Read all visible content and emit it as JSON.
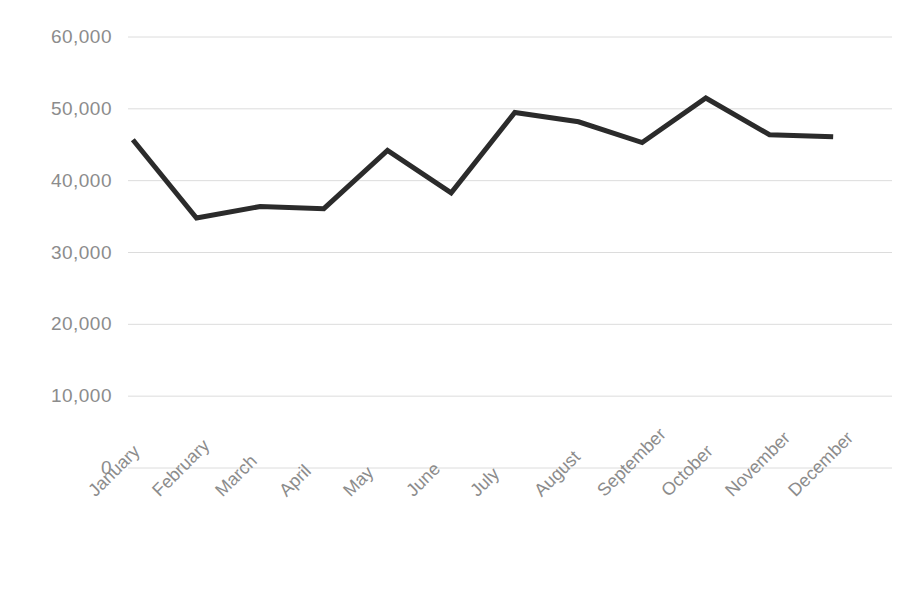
{
  "chart_data": {
    "type": "line",
    "title": "",
    "subtitle": "",
    "xlabel": "",
    "ylabel": "",
    "categories": [
      "January",
      "February",
      "March",
      "April",
      "May",
      "June",
      "July",
      "August",
      "September",
      "October",
      "November",
      "December"
    ],
    "series": [
      {
        "name": "",
        "values": [
          45700,
          34800,
          36400,
          36100,
          44200,
          38300,
          49500,
          48200,
          45300,
          51500,
          46400,
          46100
        ]
      }
    ],
    "ytick_labels": [
      "60,000",
      "50,000",
      "40,000",
      "30,000",
      "20,000",
      "10,000",
      "0"
    ],
    "ytick_values": [
      60000,
      50000,
      40000,
      30000,
      20000,
      10000,
      0
    ],
    "ylim": [
      0,
      60000
    ],
    "grid": true,
    "grid_axis": "y",
    "legend": "none",
    "line_color": "#2b2b2b",
    "grid_color": "#dcdcdc",
    "tick_label_color": "#8c8c8c",
    "background_color": "#ffffff",
    "line_width": 5,
    "xtick_rotation": -45
  }
}
